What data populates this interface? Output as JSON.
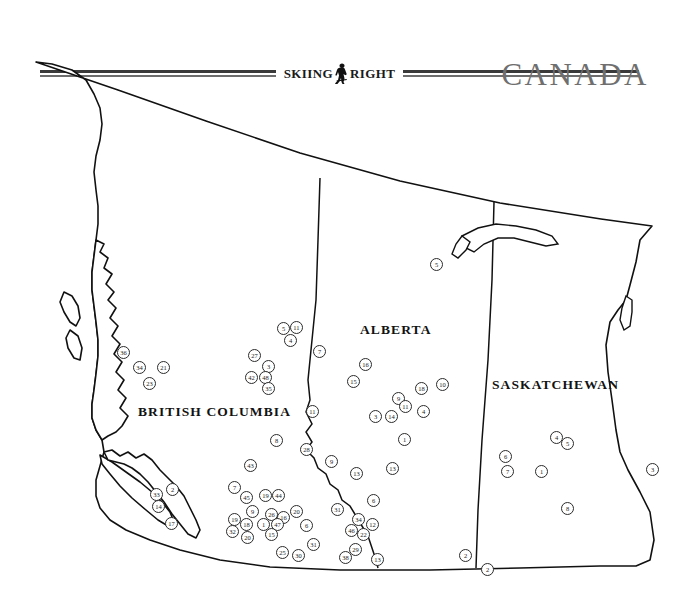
{
  "header": {
    "logo_word_left": "SKIING",
    "logo_icon": "skier-icon",
    "logo_word_right": "RIGHT",
    "rule_color": "#3a3a3a"
  },
  "country_title": "CANADA",
  "title_color": "#6f6f6f",
  "provinces": [
    {
      "name": "BRITISH COLUMBIA",
      "x": 138,
      "y": 404
    },
    {
      "name": "ALBERTA",
      "x": 360,
      "y": 322
    },
    {
      "name": "SASKATCHEWAN",
      "x": 492,
      "y": 377
    }
  ],
  "markers": [
    {
      "label": "36",
      "x": 117,
      "y": 346
    },
    {
      "label": "34",
      "x": 133,
      "y": 361
    },
    {
      "label": "21",
      "x": 157,
      "y": 361
    },
    {
      "label": "23",
      "x": 143,
      "y": 377
    },
    {
      "label": "27",
      "x": 248,
      "y": 349
    },
    {
      "label": "3",
      "x": 262,
      "y": 360
    },
    {
      "label": "42",
      "x": 245,
      "y": 371
    },
    {
      "label": "48",
      "x": 259,
      "y": 371
    },
    {
      "label": "35",
      "x": 262,
      "y": 382
    },
    {
      "label": "5",
      "x": 277,
      "y": 322
    },
    {
      "label": "11",
      "x": 290,
      "y": 321
    },
    {
      "label": "4",
      "x": 284,
      "y": 334
    },
    {
      "label": "7",
      "x": 313,
      "y": 345
    },
    {
      "label": "5",
      "x": 430,
      "y": 258
    },
    {
      "label": "16",
      "x": 359,
      "y": 358
    },
    {
      "label": "15",
      "x": 347,
      "y": 375
    },
    {
      "label": "9",
      "x": 392,
      "y": 392
    },
    {
      "label": "11",
      "x": 399,
      "y": 400
    },
    {
      "label": "18",
      "x": 415,
      "y": 382
    },
    {
      "label": "10",
      "x": 436,
      "y": 378
    },
    {
      "label": "3",
      "x": 369,
      "y": 410
    },
    {
      "label": "14",
      "x": 385,
      "y": 410
    },
    {
      "label": "4",
      "x": 417,
      "y": 405
    },
    {
      "label": "1",
      "x": 398,
      "y": 433
    },
    {
      "label": "11",
      "x": 306,
      "y": 405
    },
    {
      "label": "8",
      "x": 270,
      "y": 434
    },
    {
      "label": "28",
      "x": 300,
      "y": 443
    },
    {
      "label": "9",
      "x": 325,
      "y": 455
    },
    {
      "label": "13",
      "x": 350,
      "y": 467
    },
    {
      "label": "13",
      "x": 386,
      "y": 462
    },
    {
      "label": "43",
      "x": 244,
      "y": 459
    },
    {
      "label": "7",
      "x": 228,
      "y": 481
    },
    {
      "label": "45",
      "x": 240,
      "y": 491
    },
    {
      "label": "19",
      "x": 259,
      "y": 489
    },
    {
      "label": "44",
      "x": 272,
      "y": 489
    },
    {
      "label": "9",
      "x": 246,
      "y": 505
    },
    {
      "label": "26",
      "x": 265,
      "y": 508
    },
    {
      "label": "16",
      "x": 277,
      "y": 511
    },
    {
      "label": "20",
      "x": 290,
      "y": 505
    },
    {
      "label": "19",
      "x": 228,
      "y": 513
    },
    {
      "label": "18",
      "x": 240,
      "y": 518
    },
    {
      "label": "1",
      "x": 257,
      "y": 518
    },
    {
      "label": "47",
      "x": 271,
      "y": 518
    },
    {
      "label": "6",
      "x": 300,
      "y": 519
    },
    {
      "label": "32",
      "x": 226,
      "y": 525
    },
    {
      "label": "20",
      "x": 241,
      "y": 531
    },
    {
      "label": "15",
      "x": 265,
      "y": 528
    },
    {
      "label": "25",
      "x": 276,
      "y": 546
    },
    {
      "label": "30",
      "x": 292,
      "y": 549
    },
    {
      "label": "31",
      "x": 307,
      "y": 538
    },
    {
      "label": "31",
      "x": 331,
      "y": 503
    },
    {
      "label": "46",
      "x": 345,
      "y": 524
    },
    {
      "label": "34",
      "x": 352,
      "y": 513
    },
    {
      "label": "22",
      "x": 357,
      "y": 528
    },
    {
      "label": "12",
      "x": 366,
      "y": 518
    },
    {
      "label": "6",
      "x": 367,
      "y": 494
    },
    {
      "label": "29",
      "x": 349,
      "y": 543
    },
    {
      "label": "38",
      "x": 339,
      "y": 551
    },
    {
      "label": "13",
      "x": 371,
      "y": 553
    },
    {
      "label": "33",
      "x": 150,
      "y": 488
    },
    {
      "label": "2",
      "x": 166,
      "y": 483
    },
    {
      "label": "14",
      "x": 152,
      "y": 500
    },
    {
      "label": "17",
      "x": 165,
      "y": 517
    },
    {
      "label": "4",
      "x": 550,
      "y": 431
    },
    {
      "label": "5",
      "x": 561,
      "y": 437
    },
    {
      "label": "6",
      "x": 499,
      "y": 450
    },
    {
      "label": "7",
      "x": 501,
      "y": 465
    },
    {
      "label": "1",
      "x": 535,
      "y": 465
    },
    {
      "label": "8",
      "x": 561,
      "y": 502
    },
    {
      "label": "3",
      "x": 646,
      "y": 463
    },
    {
      "label": "2",
      "x": 459,
      "y": 549
    },
    {
      "label": "2",
      "x": 481,
      "y": 563
    }
  ]
}
